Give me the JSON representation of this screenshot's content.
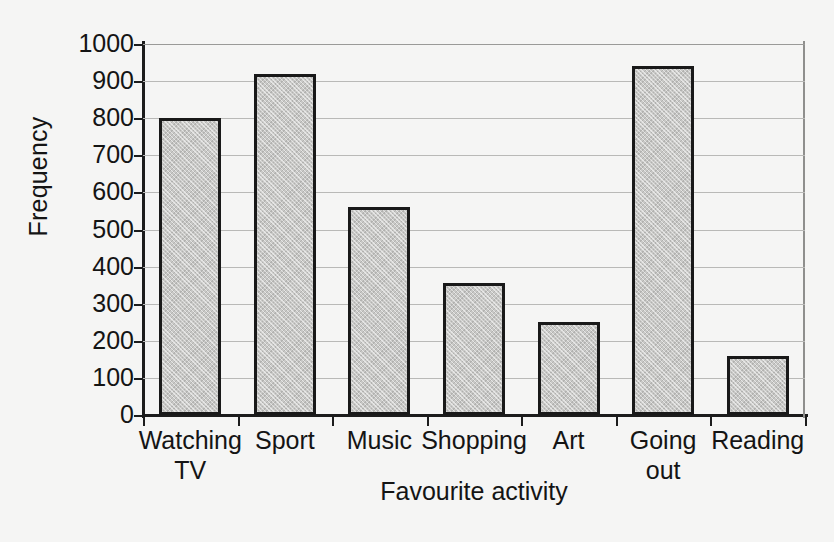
{
  "chart_data": {
    "type": "bar",
    "title": "",
    "xlabel": "Favourite activity",
    "ylabel": "Frequency",
    "categories": [
      "Watching TV",
      "Sport",
      "Music",
      "Shopping",
      "Art",
      "Going out",
      "Reading"
    ],
    "category_lines": [
      [
        "Watching",
        "TV"
      ],
      [
        "Sport"
      ],
      [
        "Music"
      ],
      [
        "Shopping"
      ],
      [
        "Art"
      ],
      [
        "Going",
        "out"
      ],
      [
        "Reading"
      ]
    ],
    "values": [
      800,
      920,
      560,
      355,
      250,
      940,
      160
    ],
    "ylim": [
      0,
      1000
    ],
    "yticks": [
      0,
      100,
      200,
      300,
      400,
      500,
      600,
      700,
      800,
      900,
      1000
    ],
    "ytick_labels": [
      "0",
      "100",
      "200",
      "300",
      "400",
      "500",
      "600",
      "700",
      "800",
      "900",
      "1000"
    ],
    "grid": true,
    "grid_axis": "y",
    "legend": null,
    "bar_fill": "#c8c8c6",
    "bar_edge": "#191919",
    "background": "#f5f5f4",
    "gridline_color": "#b9b9b7"
  }
}
